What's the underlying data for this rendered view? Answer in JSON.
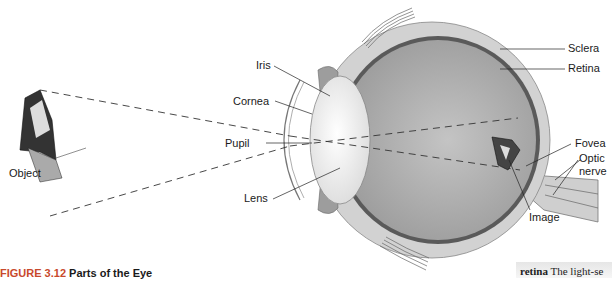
{
  "figure": {
    "caption_number": "FIGURE 3.12",
    "caption_title": "Parts of the Eye"
  },
  "labels": {
    "object": "Object",
    "iris": "Iris",
    "cornea": "Cornea",
    "pupil": "Pupil",
    "lens": "Lens",
    "sclera": "Sclera",
    "retina": "Retina",
    "fovea": "Fovea",
    "optic_nerve_line1": "Optic",
    "optic_nerve_line2": "nerve",
    "image": "Image"
  },
  "glossary": {
    "term": "retina",
    "definition_fragment": "The light-se"
  },
  "colors": {
    "caption_number": "#c8492c",
    "sclera": "#cfcfcf",
    "vitreous": "#a8a8a8",
    "retina": "#555555",
    "lens": "#f2f2f2"
  }
}
